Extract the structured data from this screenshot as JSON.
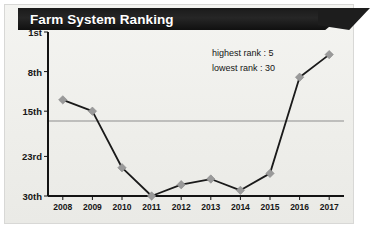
{
  "figure": {
    "title": "Farm System Ranking",
    "background_color": "#f0f0ec",
    "ribbon_color": "#1b1b1b",
    "title_color": "#ffffff"
  },
  "annotations": {
    "highest": "highest rank : 5",
    "lowest": "lowest rank : 30"
  },
  "chart_data": {
    "type": "line",
    "title": "Farm System Ranking",
    "xlabel": "",
    "ylabel": "",
    "x": [
      "2008",
      "2009",
      "2010",
      "2011",
      "2012",
      "2013",
      "2014",
      "2015",
      "2016",
      "2017"
    ],
    "categories": [
      "2008",
      "2009",
      "2010",
      "2011",
      "2012",
      "2013",
      "2014",
      "2015",
      "2016",
      "2017"
    ],
    "values": [
      13,
      15,
      25,
      30,
      28,
      27,
      29,
      26,
      9,
      5
    ],
    "series": [
      {
        "name": "Farm system rank",
        "values": [
          13,
          15,
          25,
          30,
          28,
          27,
          29,
          26,
          9,
          5
        ]
      }
    ],
    "ytick_labels": [
      "1st",
      "8th",
      "15th",
      "23rd",
      "30th"
    ],
    "ytick_values": [
      1,
      8,
      15,
      23,
      30
    ],
    "xtick_labels": [
      "2008",
      "2009",
      "2010",
      "2011",
      "2012",
      "2013",
      "2014",
      "2015",
      "2016",
      "2017"
    ],
    "ylim": [
      1,
      30
    ],
    "y_inverted": true,
    "grid": "single horizontal gridline at 15th",
    "gridline_at": 15,
    "legend": "none",
    "annotations": [
      "highest rank : 5",
      "lowest rank : 30"
    ],
    "line_color": "#1a1a1a",
    "marker_color": "#9a9a9a",
    "marker_shape": "diamond",
    "axis_color": "#111111"
  }
}
